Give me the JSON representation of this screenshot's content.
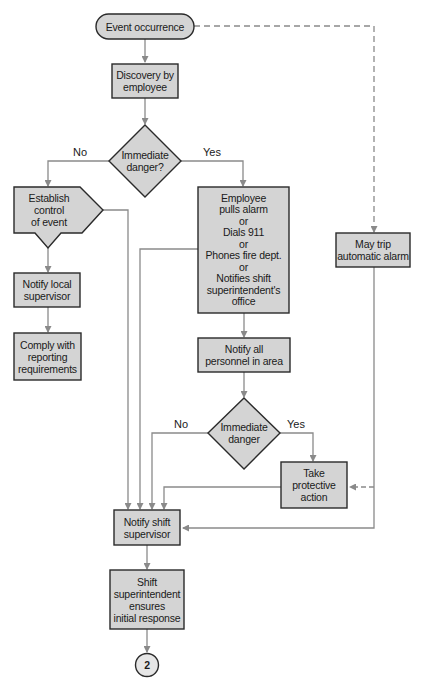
{
  "diagram": {
    "type": "flowchart",
    "colors": {
      "fill": "#d4d4d4",
      "border": "#2a2a2a",
      "connector": "#8a8a8a",
      "text": "#1a1a1a"
    },
    "nodes": {
      "start": {
        "shape": "terminator",
        "text": "Event occurrence"
      },
      "discovery": {
        "shape": "process",
        "text": "Discovery by\nemployee"
      },
      "decision1": {
        "shape": "decision",
        "text": "Immediate\ndanger?"
      },
      "establish": {
        "shape": "off-page/pentagon",
        "text": "Establish\ncontrol\nof event"
      },
      "notify_local": {
        "shape": "process",
        "text": "Notify local\nsupervisor"
      },
      "comply": {
        "shape": "process",
        "text": "Comply with\nreporting\nrequirements"
      },
      "employee_action": {
        "shape": "process",
        "text": "Employee\npulls alarm\nor\nDials 911\nor\nPhones fire dept.\nor\nNotifies shift\nsuperintendent's\noffice"
      },
      "notify_all": {
        "shape": "process",
        "text": "Notify all\npersonnel in area"
      },
      "decision2": {
        "shape": "decision",
        "text": "Immediate\ndanger"
      },
      "protective": {
        "shape": "process",
        "text": "Take\nprotective\naction"
      },
      "auto_alarm": {
        "shape": "process",
        "text": "May trip\nautomatic alarm"
      },
      "notify_shift": {
        "shape": "process",
        "text": "Notify shift\nsupervisor"
      },
      "superintendent": {
        "shape": "process",
        "text": "Shift\nsuperintendent\nensures\ninitial response"
      },
      "connector2": {
        "shape": "connector",
        "text": "2"
      }
    },
    "labels": {
      "d1_no": "No",
      "d1_yes": "Yes",
      "d2_no": "No",
      "d2_yes": "Yes"
    },
    "edges": [
      {
        "from": "start",
        "to": "discovery",
        "style": "solid"
      },
      {
        "from": "start",
        "to": "auto_alarm",
        "style": "dashed"
      },
      {
        "from": "discovery",
        "to": "decision1",
        "style": "solid"
      },
      {
        "from": "decision1",
        "to": "establish",
        "label": "No",
        "style": "solid"
      },
      {
        "from": "decision1",
        "to": "employee_action",
        "label": "Yes",
        "style": "solid"
      },
      {
        "from": "establish",
        "to": "notify_local",
        "style": "solid"
      },
      {
        "from": "establish",
        "to": "notify_shift",
        "style": "solid"
      },
      {
        "from": "notify_local",
        "to": "comply",
        "style": "solid"
      },
      {
        "from": "employee_action",
        "to": "notify_all",
        "style": "solid"
      },
      {
        "from": "employee_action",
        "to": "notify_shift",
        "style": "solid"
      },
      {
        "from": "notify_all",
        "to": "decision2",
        "style": "solid"
      },
      {
        "from": "decision2",
        "to": "notify_shift",
        "label": "No",
        "style": "solid"
      },
      {
        "from": "decision2",
        "to": "protective",
        "label": "Yes",
        "style": "solid"
      },
      {
        "from": "protective",
        "to": "notify_shift",
        "style": "solid"
      },
      {
        "from": "auto_alarm",
        "to": "protective",
        "style": "dashed"
      },
      {
        "from": "auto_alarm",
        "to": "notify_shift",
        "style": "solid"
      },
      {
        "from": "notify_shift",
        "to": "superintendent",
        "style": "solid"
      },
      {
        "from": "superintendent",
        "to": "connector2",
        "style": "solid"
      }
    ]
  }
}
